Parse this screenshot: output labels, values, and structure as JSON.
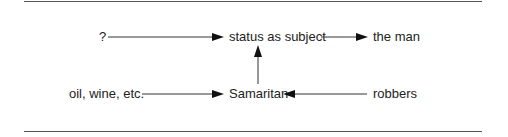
{
  "diagram": {
    "nodes": {
      "unknown": "?",
      "status": "status as subject",
      "man": "the man",
      "oil": "oil, wine, etc.",
      "samaritan": "Samaritan",
      "robbers": "robbers"
    },
    "edges": [
      {
        "from": "?",
        "to": "status as subject"
      },
      {
        "from": "status as subject",
        "to": "the man"
      },
      {
        "from": "oil, wine, etc.",
        "to": "Samaritan"
      },
      {
        "from": "robbers",
        "to": "Samaritan"
      },
      {
        "from": "Samaritan",
        "to": "status as subject"
      }
    ]
  }
}
